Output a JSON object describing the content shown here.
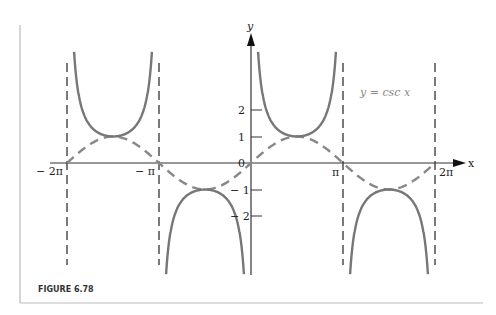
{
  "figure": {
    "caption": "FIGURE 6.78"
  },
  "chart_data": {
    "type": "line",
    "title": "",
    "annotation": "y = csc x",
    "xlabel": "x",
    "ylabel": "y",
    "x_ticks": [
      "− 2π",
      "− π",
      "0",
      "π",
      "2π"
    ],
    "y_ticks": [
      "2",
      "1",
      "− 1",
      "− 2"
    ],
    "xlim": [
      -6.9,
      7.2
    ],
    "ylim": [
      -4.2,
      4.3
    ],
    "series": [
      {
        "name": "csc x",
        "style": "solid",
        "function": "1/sin(x)",
        "color": "#777777"
      },
      {
        "name": "sin x",
        "style": "dashed",
        "function": "sin(x)",
        "color": "#888888"
      }
    ],
    "asymptotes": [
      "-2π",
      "-π",
      "π",
      "2π"
    ],
    "grid": false
  },
  "labels": {
    "x_axis": "x",
    "y_axis": "y",
    "equation": "y = csc x",
    "tick_neg2pi": "− 2π",
    "tick_negpi": "− π",
    "tick_zero": "0",
    "tick_pi": "π",
    "tick_2pi": "2π",
    "y2": "2",
    "y1": "1",
    "yn1": "− 1",
    "yn2": "− 2"
  }
}
